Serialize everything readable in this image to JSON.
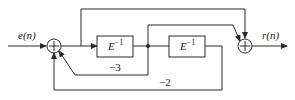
{
  "diagram": {
    "type": "signal-flow block diagram",
    "input_label": "e(n)",
    "output_label": "r(n)",
    "blocks": [
      {
        "id": "delay1",
        "label_base": "E",
        "label_exp": "−1"
      },
      {
        "id": "delay2",
        "label_base": "E",
        "label_exp": "−1"
      }
    ],
    "adders": [
      {
        "id": "adder1",
        "symbol": "+"
      },
      {
        "id": "adder2",
        "symbol": "+"
      }
    ],
    "gains": [
      {
        "id": "gain-inner-feedback",
        "value": "−3"
      },
      {
        "id": "gain-outer-feedback",
        "value": "−2"
      }
    ],
    "colors": {
      "line": "#2a2a2a",
      "background": "#ffffff"
    }
  }
}
